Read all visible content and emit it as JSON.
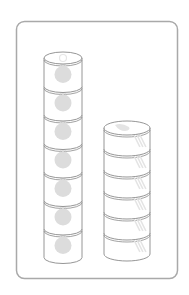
{
  "figure": {
    "colors": {
      "frame": "#a9a9a9",
      "outline": "#8a8a8a",
      "fruit": "#dcdcdc",
      "shine": "#e4e4e4",
      "background": "#ffffff"
    },
    "stacks": [
      {
        "name": "left-stack",
        "can_count": 7,
        "can_type": "tall fruit can",
        "x": 44,
        "width": 38,
        "top": 58,
        "can_height": 28.5
      },
      {
        "name": "right-stack",
        "can_count": 6,
        "can_type": "short flat can",
        "x": 104,
        "width": 46,
        "top": 128,
        "can_height": 21
      }
    ]
  }
}
